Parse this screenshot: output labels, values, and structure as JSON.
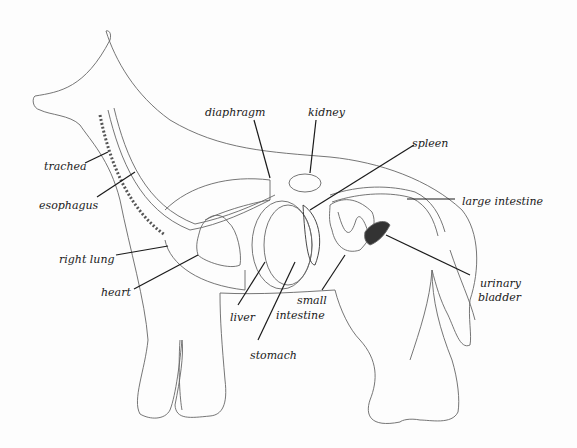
{
  "diagram": {
    "colors": {
      "outline": "#555555",
      "leader": "#1a1a1a",
      "background": "#fdfdfd"
    },
    "labels": [
      {
        "id": "trachea",
        "text": "trachea",
        "x": 44,
        "y": 161
      },
      {
        "id": "esophagus",
        "text": "esophagus",
        "x": 39,
        "y": 200
      },
      {
        "id": "right-lung",
        "text": "right lung",
        "x": 59,
        "y": 254
      },
      {
        "id": "heart",
        "text": "heart",
        "x": 101,
        "y": 287
      },
      {
        "id": "diaphragm",
        "text": "diaphragm",
        "x": 205,
        "y": 107
      },
      {
        "id": "kidney",
        "text": "kidney",
        "x": 308,
        "y": 107
      },
      {
        "id": "spleen",
        "text": "spleen",
        "x": 412,
        "y": 138
      },
      {
        "id": "large-intestine",
        "text": "large intestine",
        "x": 462,
        "y": 196
      },
      {
        "id": "urinary-bladder-1",
        "text": "urinary",
        "x": 480,
        "y": 278
      },
      {
        "id": "urinary-bladder-2",
        "text": "bladder",
        "x": 478,
        "y": 292
      },
      {
        "id": "liver",
        "text": "liver",
        "x": 230,
        "y": 312
      },
      {
        "id": "small-intestine-1",
        "text": "small",
        "x": 297,
        "y": 295
      },
      {
        "id": "small-intestine-2",
        "text": "intestine",
        "x": 276,
        "y": 310
      },
      {
        "id": "stomach",
        "text": "stomach",
        "x": 250,
        "y": 350
      }
    ]
  }
}
